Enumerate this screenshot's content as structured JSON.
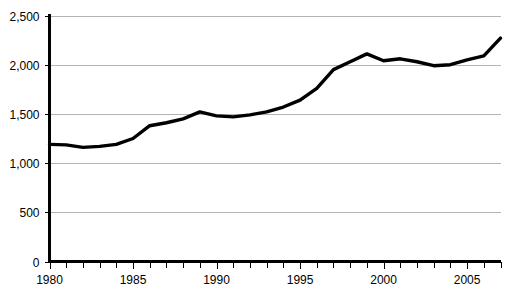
{
  "chart_data": {
    "type": "line",
    "title": "",
    "subtitle": "",
    "xlabel": "",
    "ylabel": "",
    "xlim": [
      1980,
      2007
    ],
    "ylim": [
      0,
      2500
    ],
    "grid": true,
    "legend": false,
    "legend_position": "none",
    "y_ticks": [
      0,
      500,
      1000,
      1500,
      2000,
      2500
    ],
    "y_tick_labels": [
      "0",
      "500",
      "1,000",
      "1,500",
      "2,000",
      "2,500"
    ],
    "x_ticks": [
      1980,
      1981,
      1982,
      1983,
      1984,
      1985,
      1986,
      1987,
      1988,
      1989,
      1990,
      1991,
      1992,
      1993,
      1994,
      1995,
      1996,
      1997,
      1998,
      1999,
      2000,
      2001,
      2002,
      2003,
      2004,
      2005,
      2006,
      2007
    ],
    "x_tick_labels": [
      "1980",
      "1985",
      "1990",
      "1995",
      "2000",
      "2005"
    ],
    "x_tick_label_years": [
      1980,
      1985,
      1990,
      1995,
      2000,
      2005
    ],
    "x": [
      1980,
      1981,
      1982,
      1983,
      1984,
      1985,
      1986,
      1987,
      1988,
      1989,
      1990,
      1991,
      1992,
      1993,
      1994,
      1995,
      1996,
      1997,
      1998,
      1999,
      2000,
      2001,
      2002,
      2003,
      2004,
      2005,
      2006,
      2007
    ],
    "values": [
      1190,
      1185,
      1160,
      1170,
      1190,
      1250,
      1380,
      1410,
      1450,
      1520,
      1480,
      1470,
      1490,
      1520,
      1570,
      1640,
      1760,
      1950,
      2030,
      2110,
      2040,
      2060,
      2030,
      1990,
      2000,
      2050,
      2090,
      2270
    ],
    "series": [
      {
        "name": "series-1",
        "color": "#000000",
        "values": [
          1190,
          1185,
          1160,
          1170,
          1190,
          1250,
          1380,
          1410,
          1450,
          1520,
          1480,
          1470,
          1490,
          1520,
          1570,
          1640,
          1760,
          1950,
          2030,
          2110,
          2040,
          2060,
          2030,
          1990,
          2000,
          2050,
          2090,
          2270
        ]
      }
    ],
    "colors": {
      "line": "#000000",
      "grid": "#b3b3b3",
      "axis": "#000000",
      "background": "#ffffff",
      "text": "#000000"
    }
  }
}
